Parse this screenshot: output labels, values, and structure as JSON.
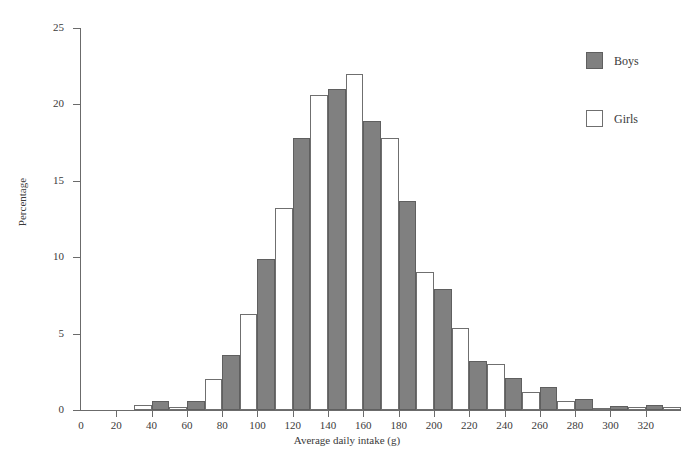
{
  "chart_data": {
    "type": "bar",
    "title": "",
    "subtitle": "",
    "xlabel": "Average daily intake (g)",
    "ylabel": "Percentage",
    "xlim": [
      0,
      340
    ],
    "ylim": [
      0,
      25
    ],
    "grid": false,
    "legend_position": "top-right",
    "bin_width": 20,
    "x_ticks": [
      20,
      40,
      60,
      80,
      100,
      120,
      140,
      160,
      180,
      200,
      220,
      240,
      260,
      280,
      300,
      320
    ],
    "y_ticks": [
      0,
      5,
      10,
      15,
      20,
      25
    ],
    "categories": [
      "20-40",
      "40-60",
      "60-80",
      "80-100",
      "100-120",
      "120-140",
      "140-160",
      "160-180",
      "180-200",
      "200-220",
      "220-240",
      "240-260",
      "260-280",
      "280-300",
      "300-320",
      "320-340"
    ],
    "bin_starts": [
      20,
      40,
      60,
      80,
      100,
      120,
      140,
      160,
      180,
      200,
      220,
      240,
      260,
      280,
      300,
      320
    ],
    "series": [
      {
        "name": "Boys",
        "color": "#808080",
        "border": "#5f5f5f",
        "values": [
          0.0,
          0.6,
          0.6,
          3.6,
          9.9,
          17.8,
          21.0,
          18.9,
          13.7,
          7.9,
          3.2,
          2.1,
          1.5,
          0.7,
          0.25,
          0.3
        ]
      },
      {
        "name": "Girls",
        "color": "#ffffff",
        "border": "#6f6f6f",
        "values": [
          0.3,
          0.2,
          2.0,
          6.3,
          13.2,
          20.6,
          22.0,
          17.8,
          9.0,
          5.4,
          3.0,
          1.2,
          0.6,
          0.15,
          0.2,
          0.2
        ]
      }
    ]
  },
  "legend": {
    "items": [
      {
        "label": "Boys",
        "swatch": "filled-gray"
      },
      {
        "label": "Girls",
        "swatch": "outlined-white"
      }
    ]
  },
  "axes": {
    "y_title": "Percentage",
    "x_title": "Average daily intake (g)",
    "y_tick_labels": [
      "0",
      "5",
      "10",
      "15",
      "20",
      "25"
    ],
    "x_tick_labels": [
      "20",
      "40",
      "60",
      "80",
      "100",
      "120",
      "140",
      "160",
      "180",
      "200",
      "220",
      "240",
      "260",
      "280",
      "300",
      "320"
    ]
  },
  "colors": {
    "boys_fill": "#808080",
    "boys_border": "#5f5f5f",
    "girls_fill": "#ffffff",
    "girls_border": "#6f6f6f",
    "axis": "#6b6b6b",
    "text": "#3a3a3a",
    "background": "#ffffff"
  }
}
